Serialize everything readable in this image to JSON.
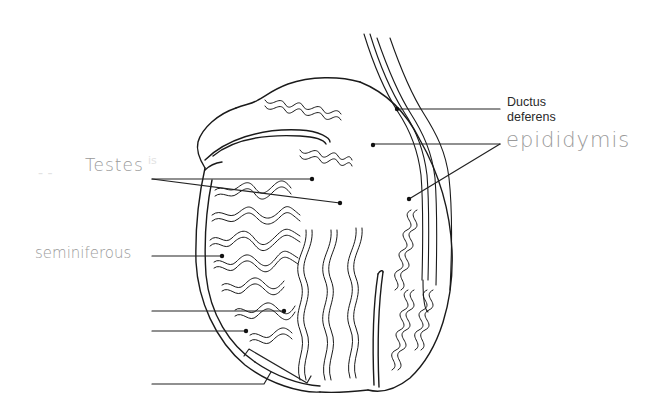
{
  "diagram": {
    "type": "anatomy-labeling",
    "labels": {
      "ductus_deferens": {
        "line1": "Ductus",
        "line2": "deferens"
      },
      "epididymis": "epididymis",
      "testes": "Testes",
      "seminiferous": "seminiferous",
      "blank_1": "",
      "blank_2": "",
      "blank_3": ""
    },
    "ghost_marks": {
      "left_of_testes": "- -",
      "right_of_testes": "is"
    },
    "colors": {
      "ink": "#1a1a1a",
      "handwriting": "#9a9a9a",
      "background": "#ffffff"
    }
  }
}
